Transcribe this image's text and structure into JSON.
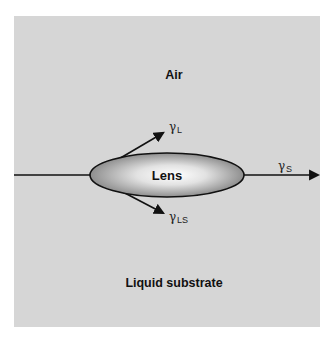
{
  "diagram": {
    "colors": {
      "panel_background": "#d6d6d6",
      "page_background": "#ffffff",
      "line": "#111111",
      "lens_center": "#ffffff",
      "lens_edge": "#8a8a8a"
    },
    "regions": {
      "top": "Air",
      "bottom": "Liquid substrate"
    },
    "lens": {
      "label": "Lens"
    },
    "vectors": [
      {
        "id": "gamma_L",
        "symbol": "γ",
        "subscript": "L",
        "direction": "up-right along air/lens interface"
      },
      {
        "id": "gamma_LS",
        "symbol": "γ",
        "subscript": "LS",
        "direction": "down-right along lens/substrate interface"
      },
      {
        "id": "gamma_S",
        "symbol": "γ",
        "subscript": "S",
        "direction": "right along air/substrate interface"
      }
    ]
  }
}
